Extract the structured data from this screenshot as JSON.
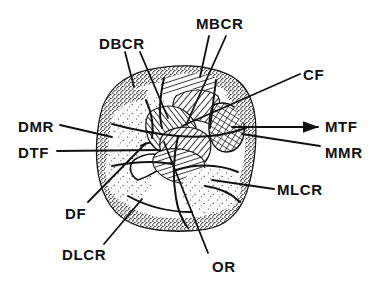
{
  "figure": {
    "ink_color": "#111111",
    "background_color": "#ffffff",
    "width": 373,
    "height": 288
  },
  "labels": [
    {
      "id": "DBCR",
      "text": "DBCR",
      "x": 99,
      "y": 36,
      "meaning": "distobuccal crest ridge"
    },
    {
      "id": "MBCR",
      "text": "MBCR",
      "x": 196,
      "y": 16,
      "meaning": "mesiobuccal crest ridge"
    },
    {
      "id": "CF",
      "text": "CF",
      "x": 303,
      "y": 67,
      "meaning": "central fossa"
    },
    {
      "id": "DMR",
      "text": "DMR",
      "x": 18,
      "y": 119,
      "meaning": "distal marginal ridge"
    },
    {
      "id": "MTF",
      "text": "MTF",
      "x": 325,
      "y": 119,
      "meaning": "mesial triangular fossa"
    },
    {
      "id": "DTF",
      "text": "DTF",
      "x": 18,
      "y": 145,
      "meaning": "distal triangular fossa"
    },
    {
      "id": "MMR",
      "text": "MMR",
      "x": 325,
      "y": 145,
      "meaning": "mesial marginal ridge"
    },
    {
      "id": "MLCR",
      "text": "MLCR",
      "x": 277,
      "y": 182,
      "meaning": "mesiolingual crest ridge"
    },
    {
      "id": "DF",
      "text": "DF",
      "x": 65,
      "y": 206,
      "meaning": "distal fossa"
    },
    {
      "id": "DLCR",
      "text": "DLCR",
      "x": 62,
      "y": 247,
      "meaning": "distolingual crest ridge"
    },
    {
      "id": "OR",
      "text": "OR",
      "x": 212,
      "y": 259,
      "meaning": "oblique ridge"
    }
  ],
  "leader_lines": [
    {
      "label": "DBCR",
      "path": "M 125 52 L 134 87",
      "arrow": false
    },
    {
      "label": "DBCR",
      "path": "M 140 52 L 168 118",
      "arrow": false
    },
    {
      "label": "MBCR",
      "path": "M 209 36 L 200 77",
      "arrow": false
    },
    {
      "label": "MBCR",
      "path": "M 226 36 L 186 125",
      "arrow": false
    },
    {
      "label": "CF",
      "path": "M 300 74 L 182 126",
      "arrow": false
    },
    {
      "label": "DMR",
      "path": "M 60 125 L 112 137",
      "arrow": false
    },
    {
      "label": "DTF",
      "path": "M 57 151 L 160 150",
      "arrow": false
    },
    {
      "label": "MTF",
      "path": "M 321 127 L 232 127",
      "arrow": true
    },
    {
      "label": "MMR",
      "path": "M 320 146 L 242 134",
      "arrow": false
    },
    {
      "label": "MLCR",
      "path": "M 274 189 L 212 180",
      "arrow": false
    },
    {
      "label": "DF",
      "path": "M 88 202 L 146 143",
      "arrow": false
    },
    {
      "label": "DLCR",
      "path": "M 104 244 L 142 199",
      "arrow": false
    },
    {
      "label": "OR",
      "path": "M 208 253 L 164 142",
      "arrow": false
    }
  ],
  "drawing": {
    "outline_name": "tooth-crown-outline",
    "regions": [
      {
        "name": "buccal-cusp-ridge-field",
        "fill": "stipple"
      },
      {
        "name": "central-fossa-hatch",
        "fill": "hatch"
      },
      {
        "name": "mesial-triangular-fossa",
        "fill": "crosshatch"
      },
      {
        "name": "distal-marginal-ridge",
        "fill": "stipple"
      },
      {
        "name": "oblique-ridge-hatch",
        "fill": "hatch"
      },
      {
        "name": "lingual-surface-field",
        "fill": "stipple"
      }
    ]
  }
}
